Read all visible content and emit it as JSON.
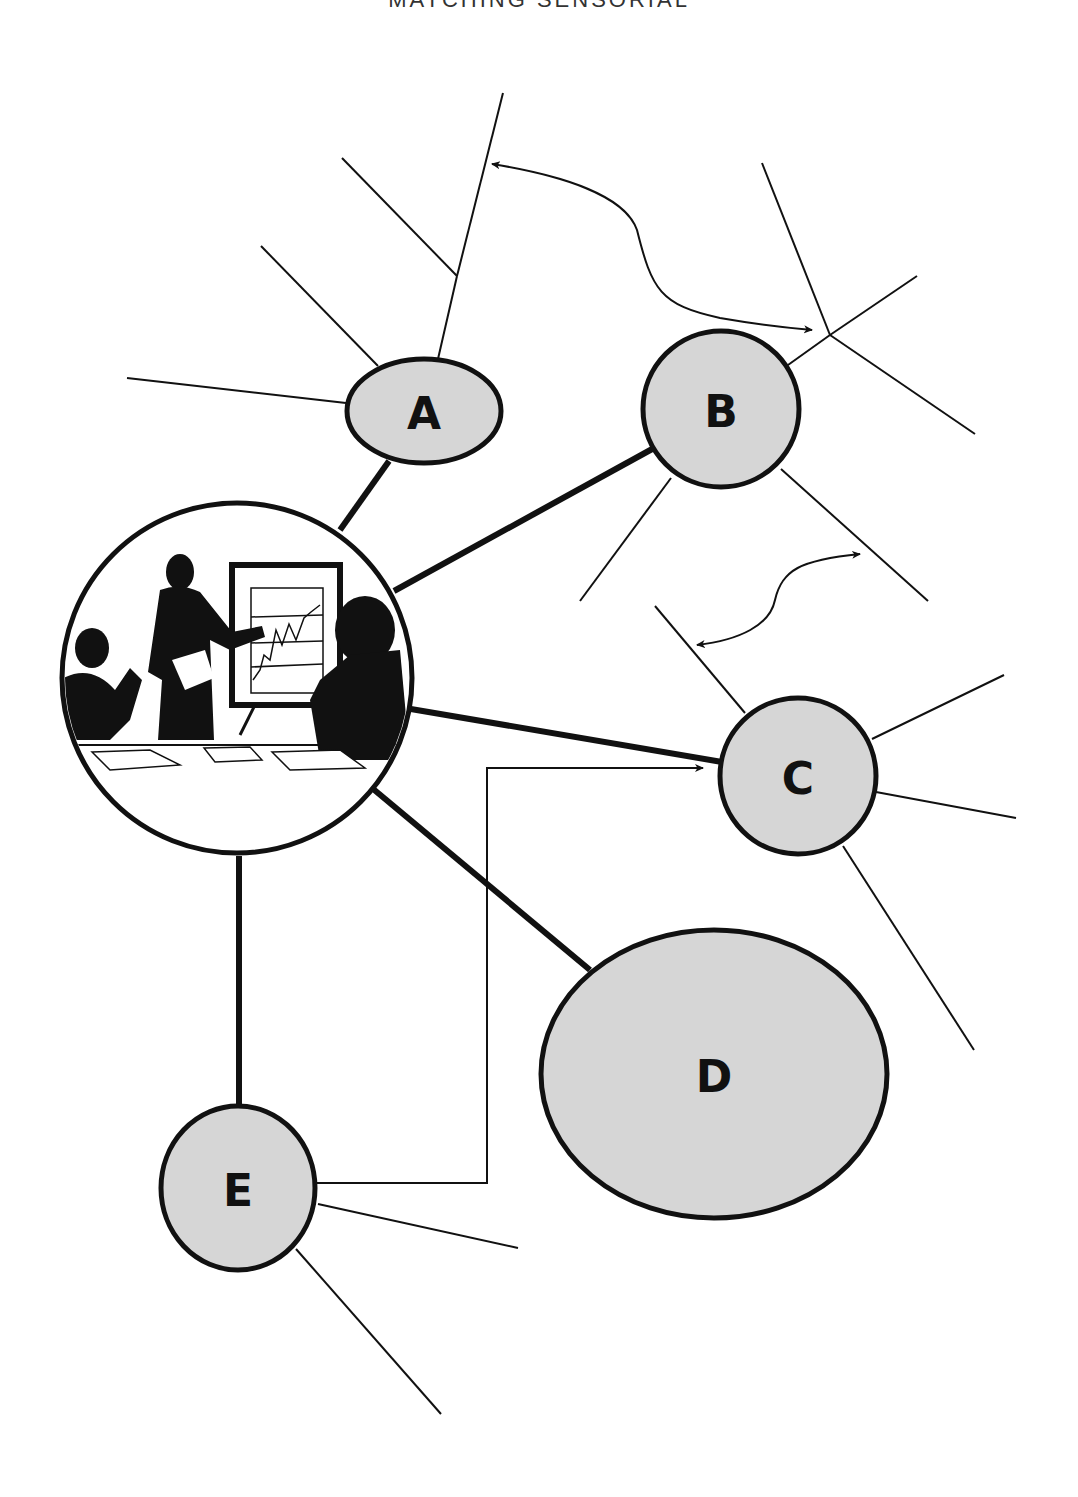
{
  "header": {
    "title": "MATCHING SENSORIAL",
    "title_partially_visible": true
  },
  "diagram": {
    "type": "mind-map",
    "center": {
      "illustration": "business-presentation-silhouette",
      "description": "presenter pointing at flip chart with rising line graph, audience seated at table"
    },
    "nodes": [
      {
        "id": "A",
        "label": "A"
      },
      {
        "id": "B",
        "label": "B"
      },
      {
        "id": "C",
        "label": "C"
      },
      {
        "id": "D",
        "label": "D"
      },
      {
        "id": "E",
        "label": "E"
      }
    ],
    "connections": [
      {
        "from": "center",
        "to": "A",
        "style": "thick"
      },
      {
        "from": "center",
        "to": "B",
        "style": "thick"
      },
      {
        "from": "center",
        "to": "C",
        "style": "thick"
      },
      {
        "from": "center",
        "to": "D",
        "style": "thick"
      },
      {
        "from": "center",
        "to": "E",
        "style": "thick"
      },
      {
        "from": "E",
        "to": "C",
        "style": "elbow-arrow"
      },
      {
        "from": "A-branch",
        "to": "B-branch",
        "style": "curved-double-arrow"
      },
      {
        "from": "B-branch",
        "to": "C-branch",
        "style": "curved-double-arrow"
      }
    ],
    "branch_counts": {
      "A": 4,
      "B": 5,
      "C": 4,
      "D": 0,
      "E": 2
    }
  },
  "colors": {
    "node_fill": "#d6d6d6",
    "stroke": "#111111",
    "background": "#ffffff"
  }
}
